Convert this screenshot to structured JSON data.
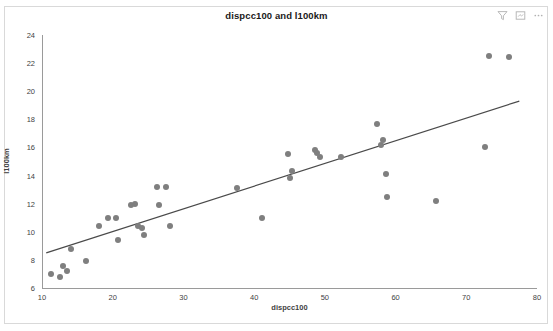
{
  "header": {
    "title": "dispcc100 and l100km",
    "icons": [
      {
        "name": "filter-icon",
        "glyph": "funnel"
      },
      {
        "name": "focus-mode-icon",
        "glyph": "frame"
      },
      {
        "name": "more-options-icon",
        "glyph": "ellipsis"
      }
    ]
  },
  "colors": {
    "marker": "#7f7f7f",
    "trendline": "#4a4a4a",
    "axis": "#9a9a9a",
    "text": "#3f3f3f",
    "title": "#1a1a1a",
    "frame": "#d9d9d9",
    "background": "#ffffff"
  },
  "chart_data": {
    "type": "scatter",
    "title": "dispcc100 and l100km",
    "xlabel": "dispcc100",
    "ylabel": "l100km",
    "xlim": [
      10,
      80
    ],
    "ylim": [
      6,
      24
    ],
    "xticks": [
      10,
      20,
      30,
      40,
      50,
      60,
      70,
      80
    ],
    "yticks": [
      6,
      8,
      10,
      12,
      14,
      16,
      18,
      20,
      22,
      24
    ],
    "grid": false,
    "legend": "none",
    "series": [
      {
        "name": "dispcc100 vs l100km",
        "marker": "circle",
        "color": "#7f7f7f",
        "points": [
          [
            11.3,
            7.0
          ],
          [
            12.6,
            6.8
          ],
          [
            13.0,
            7.6
          ],
          [
            13.6,
            7.2
          ],
          [
            14.1,
            8.8
          ],
          [
            16.2,
            7.9
          ],
          [
            18.0,
            10.4
          ],
          [
            19.4,
            11.0
          ],
          [
            20.5,
            11.0
          ],
          [
            20.8,
            9.4
          ],
          [
            22.6,
            11.9
          ],
          [
            23.2,
            12.0
          ],
          [
            23.6,
            10.4
          ],
          [
            24.2,
            10.3
          ],
          [
            24.4,
            9.8
          ],
          [
            26.2,
            13.2
          ],
          [
            26.6,
            11.9
          ],
          [
            27.5,
            13.2
          ],
          [
            28.1,
            10.4
          ],
          [
            37.6,
            13.1
          ],
          [
            41.1,
            11.0
          ],
          [
            44.8,
            15.5
          ],
          [
            45.0,
            13.8
          ],
          [
            45.3,
            14.3
          ],
          [
            48.6,
            15.8
          ],
          [
            48.9,
            15.6
          ],
          [
            49.3,
            15.3
          ],
          [
            52.3,
            15.3
          ],
          [
            57.4,
            17.7
          ],
          [
            58.0,
            16.2
          ],
          [
            58.2,
            16.5
          ],
          [
            58.6,
            14.1
          ],
          [
            58.8,
            12.5
          ],
          [
            65.7,
            12.2
          ],
          [
            72.6,
            16.0
          ],
          [
            73.2,
            22.5
          ],
          [
            76.0,
            22.4
          ]
        ]
      }
    ],
    "trendline": {
      "name": "linear-fit",
      "color": "#4a4a4a",
      "x1": 10.6,
      "y1": 8.5,
      "x2": 77.5,
      "y2": 19.3
    }
  }
}
